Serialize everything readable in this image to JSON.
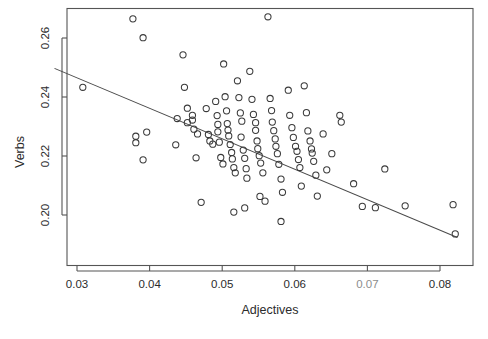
{
  "chart_data": {
    "type": "scatter",
    "title": "",
    "xlabel": "Adjectives",
    "ylabel": "Verbs",
    "xlim": [
      0.0269,
      0.0824
    ],
    "ylim": [
      0.1915,
      0.2682
    ],
    "xticks": [
      0.03,
      0.04,
      0.05,
      0.06,
      0.07,
      0.08
    ],
    "xticklabels": [
      "0.03",
      "0.04",
      "0.05",
      "0.06",
      "0.07",
      "0.08"
    ],
    "yticks": [
      0.2,
      0.22,
      0.24,
      0.26
    ],
    "yticklabels": [
      "0.20",
      "0.22",
      "0.24",
      "0.26"
    ],
    "grid": false,
    "legend": null,
    "marker": "open-circle",
    "point_color": "#3a3a3a",
    "frame_color": "#555555",
    "trendline": {
      "type": "linear-fit",
      "color": "#4a4a4a",
      "x_start": 0.0269,
      "y_start": 0.2497,
      "x_end": 0.0824,
      "y_end": 0.1924
    },
    "n_points": 104,
    "points": [
      [
        0.0308,
        0.2433
      ],
      [
        0.0377,
        0.2665
      ],
      [
        0.0391,
        0.2601
      ],
      [
        0.0396,
        0.2281
      ],
      [
        0.0381,
        0.2267
      ],
      [
        0.0381,
        0.2245
      ],
      [
        0.0391,
        0.2187
      ],
      [
        0.0438,
        0.2327
      ],
      [
        0.0436,
        0.2238
      ],
      [
        0.0446,
        0.2543
      ],
      [
        0.0448,
        0.2433
      ],
      [
        0.0452,
        0.2362
      ],
      [
        0.0452,
        0.2313
      ],
      [
        0.0459,
        0.2338
      ],
      [
        0.0459,
        0.2322
      ],
      [
        0.0461,
        0.2291
      ],
      [
        0.0466,
        0.2275
      ],
      [
        0.0464,
        0.2194
      ],
      [
        0.0471,
        0.2043
      ],
      [
        0.0478,
        0.2361
      ],
      [
        0.0481,
        0.2273
      ],
      [
        0.0483,
        0.2251
      ],
      [
        0.0487,
        0.224
      ],
      [
        0.0491,
        0.2385
      ],
      [
        0.0493,
        0.2337
      ],
      [
        0.0494,
        0.2307
      ],
      [
        0.0494,
        0.2282
      ],
      [
        0.0496,
        0.2247
      ],
      [
        0.0498,
        0.2195
      ],
      [
        0.0501,
        0.2173
      ],
      [
        0.0502,
        0.2512
      ],
      [
        0.0504,
        0.2401
      ],
      [
        0.0506,
        0.2353
      ],
      [
        0.0507,
        0.231
      ],
      [
        0.0508,
        0.2288
      ],
      [
        0.0509,
        0.2268
      ],
      [
        0.0511,
        0.2239
      ],
      [
        0.0513,
        0.2212
      ],
      [
        0.0514,
        0.219
      ],
      [
        0.0516,
        0.2161
      ],
      [
        0.0518,
        0.2143
      ],
      [
        0.0516,
        0.201
      ],
      [
        0.0521,
        0.2455
      ],
      [
        0.0523,
        0.2398
      ],
      [
        0.0525,
        0.2346
      ],
      [
        0.0527,
        0.2318
      ],
      [
        0.0526,
        0.2264
      ],
      [
        0.0529,
        0.222
      ],
      [
        0.0531,
        0.2192
      ],
      [
        0.0533,
        0.2157
      ],
      [
        0.0534,
        0.2125
      ],
      [
        0.0531,
        0.2024
      ],
      [
        0.0538,
        0.2487
      ],
      [
        0.0541,
        0.2392
      ],
      [
        0.0543,
        0.2341
      ],
      [
        0.0546,
        0.2313
      ],
      [
        0.0546,
        0.2287
      ],
      [
        0.0548,
        0.2251
      ],
      [
        0.0549,
        0.2225
      ],
      [
        0.0551,
        0.2201
      ],
      [
        0.0553,
        0.2176
      ],
      [
        0.0556,
        0.2143
      ],
      [
        0.0552,
        0.2063
      ],
      [
        0.0559,
        0.2047
      ],
      [
        0.0563,
        0.2672
      ],
      [
        0.0566,
        0.2395
      ],
      [
        0.0568,
        0.2354
      ],
      [
        0.0569,
        0.2315
      ],
      [
        0.0571,
        0.2286
      ],
      [
        0.0573,
        0.2258
      ],
      [
        0.0574,
        0.2233
      ],
      [
        0.0576,
        0.2208
      ],
      [
        0.0578,
        0.2172
      ],
      [
        0.0581,
        0.2122
      ],
      [
        0.0583,
        0.2077
      ],
      [
        0.0581,
        0.1978
      ],
      [
        0.0591,
        0.2423
      ],
      [
        0.0593,
        0.2338
      ],
      [
        0.0596,
        0.2296
      ],
      [
        0.0598,
        0.2263
      ],
      [
        0.0601,
        0.2233
      ],
      [
        0.0603,
        0.2216
      ],
      [
        0.0605,
        0.2188
      ],
      [
        0.0607,
        0.2161
      ],
      [
        0.0609,
        0.2098
      ],
      [
        0.0613,
        0.2438
      ],
      [
        0.0616,
        0.2347
      ],
      [
        0.0618,
        0.2285
      ],
      [
        0.0621,
        0.2251
      ],
      [
        0.0623,
        0.2224
      ],
      [
        0.0624,
        0.221
      ],
      [
        0.0626,
        0.2182
      ],
      [
        0.0629,
        0.2135
      ],
      [
        0.0631,
        0.2064
      ],
      [
        0.0639,
        0.2275
      ],
      [
        0.0644,
        0.2153
      ],
      [
        0.0651,
        0.2208
      ],
      [
        0.0662,
        0.2338
      ],
      [
        0.0664,
        0.2315
      ],
      [
        0.0681,
        0.2106
      ],
      [
        0.0693,
        0.2029
      ],
      [
        0.0711,
        0.2025
      ],
      [
        0.0724,
        0.2156
      ],
      [
        0.0752,
        0.2031
      ],
      [
        0.0818,
        0.2035
      ],
      [
        0.0821,
        0.1936
      ]
    ]
  }
}
